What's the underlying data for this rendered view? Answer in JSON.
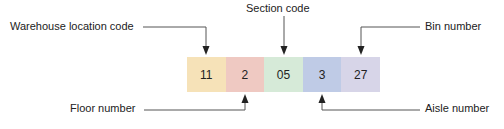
{
  "diagram": {
    "segments": [
      {
        "value": "11",
        "meaning": "Warehouse location code",
        "color": "#f6e2b8"
      },
      {
        "value": "2",
        "meaning": "Floor number",
        "color": "#efc9c2"
      },
      {
        "value": "05",
        "meaning": "Section code",
        "color": "#d6ead8"
      },
      {
        "value": "3",
        "meaning": "Aisle number",
        "color": "#bfcbe6"
      },
      {
        "value": "27",
        "meaning": "Bin number",
        "color": "#d7d5e8"
      }
    ],
    "labels": {
      "warehouse": "Warehouse location code",
      "section": "Section code",
      "bin": "Bin number",
      "floor": "Floor number",
      "aisle": "Aisle number"
    },
    "line_color": "#444444"
  }
}
